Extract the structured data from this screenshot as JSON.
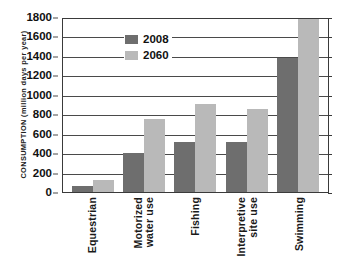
{
  "chart_data": {
    "type": "bar",
    "title": "",
    "xlabel": "",
    "ylabel": "CONSUMPTION (million days per year)",
    "ylim": [
      0,
      1800
    ],
    "ytick_step": 200,
    "yticks": [
      1800,
      1600,
      1400,
      1200,
      1000,
      800,
      600,
      400,
      200,
      0
    ],
    "grid": true,
    "legend_position": "upper-center-left",
    "categories": [
      "Equestrian",
      "Motorized water use",
      "Fishing",
      "Interpretive site use",
      "Swimming"
    ],
    "category_lines": [
      [
        "Equestrian"
      ],
      [
        "Motorized",
        "water use"
      ],
      [
        "Fishing"
      ],
      [
        "Interpretive",
        "site use"
      ],
      [
        "Swimming"
      ]
    ],
    "series": [
      {
        "name": "2008",
        "color": "#6e6e6e",
        "values": [
          60,
          400,
          510,
          510,
          1380
        ]
      },
      {
        "name": "2060",
        "color": "#b9b9b9",
        "values": [
          120,
          750,
          910,
          850,
          1780
        ]
      }
    ]
  },
  "legend": {
    "items": [
      {
        "label": "2008",
        "color": "#6e6e6e"
      },
      {
        "label": "2060",
        "color": "#b9b9b9"
      }
    ]
  },
  "colors": {
    "series_2008": "#6e6e6e",
    "series_2060": "#b9b9b9",
    "axis": "#3a3a3a",
    "gridline": "#4a4a4a",
    "background": "#ffffff",
    "text": "#1a1a1a"
  }
}
